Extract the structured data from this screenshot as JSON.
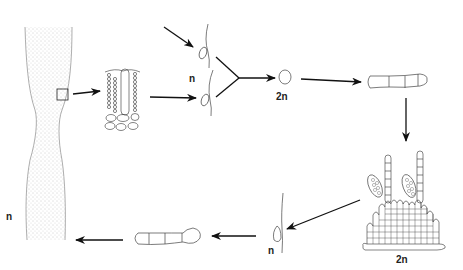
{
  "diagram": {
    "type": "life-cycle",
    "labels": {
      "thallus_ploidy": "n",
      "gametes_ploidy": "n",
      "zygote_ploidy": "2n",
      "sporophyte_ploidy": "2n",
      "spore_ploidy": "n"
    },
    "stages": [
      {
        "id": "gametophyte-thallus",
        "ploidy": "n"
      },
      {
        "id": "thallus-cross-section"
      },
      {
        "id": "gametes",
        "ploidy": "n"
      },
      {
        "id": "zygote",
        "ploidy": "2n"
      },
      {
        "id": "germling-filament"
      },
      {
        "id": "sporophyte-with-sporangia",
        "ploidy": "2n"
      },
      {
        "id": "spore",
        "ploidy": "n"
      },
      {
        "id": "young-gametophyte"
      }
    ],
    "colors": {
      "line": "#333333",
      "stipple": "#9a9a9a",
      "background": "#ffffff"
    }
  }
}
